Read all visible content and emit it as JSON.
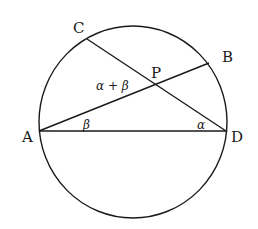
{
  "diagram": {
    "type": "circle-geometry",
    "points": {
      "A": {
        "label": "A",
        "x": 39,
        "y": 131
      },
      "B": {
        "label": "B",
        "x": 209,
        "y": 63
      },
      "C": {
        "label": "C",
        "x": 87,
        "y": 39
      },
      "D": {
        "label": "D",
        "x": 226,
        "y": 131
      },
      "P": {
        "label": "P",
        "x": 156,
        "y": 84
      }
    },
    "segments": [
      "AD",
      "AB",
      "CD"
    ],
    "angle_labels": {
      "at_A": "β",
      "at_D": "α",
      "at_P": "α + β"
    },
    "colors": {
      "stroke": "#1a1a1a",
      "background": "#ffffff"
    }
  }
}
